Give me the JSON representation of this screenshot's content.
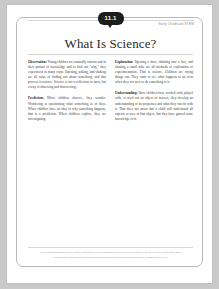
{
  "document": {
    "chapter_badge": "11.1",
    "corner_label": "Early Childhood STEM",
    "title": "What Is Science?",
    "columns": [
      {
        "paragraphs": [
          {
            "heading": "Observation:",
            "text": "Young children are naturally curious and in their pursuit of knowledge and to find out \"why,\" they experiment in many ways. Opening, poking, and shaking are all ways of finding out about something, and that process is science. Science is not a collection of facts, but a way of observing and discovering."
          },
          {
            "heading": "Prediction:",
            "text": "When children observe, they wonder. Wondering is questioning what something is or does. When children have an idea of why something happens, that is a prediction. When children explore, they are investigating."
          }
        ]
      },
      {
        "paragraphs": [
          {
            "heading": "Exploration:",
            "text": "Opening a door, thinking into a box, and shaking a small tube are all methods of exploration or experimentation. That is science. Children are trying things out. They want to see what happens to an item when they act on it or do something to it."
          },
          {
            "heading": "Understanding:",
            "text": "Once children have worked with, played with, or tried out an object of interest, they develop an understanding of its properties and what they can do with it. That does not mean that a child will understand all aspects or uses of that object, but they have gained some knowledge of it."
          }
        ]
      }
    ],
    "footer": {
      "line1": "From Understanding Science in Early Childhood, Unit of Professional Development for Staff Working in Family Child Care, 2020",
      "line2": "Published by National Press, www.childcare.org. This page may be reproduced for classroom use only."
    }
  }
}
